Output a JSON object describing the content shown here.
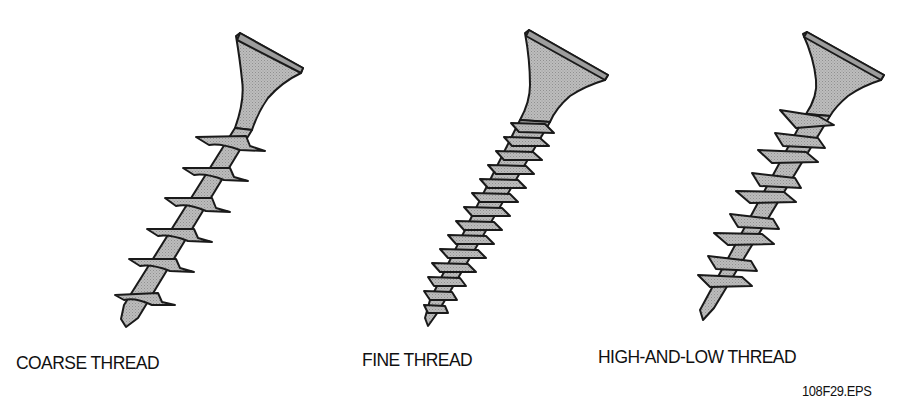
{
  "figure": {
    "screws": [
      {
        "id": "coarse",
        "label": "COARSE THREAD",
        "thread_count": 6
      },
      {
        "id": "fine",
        "label": "FINE THREAD",
        "thread_count": 14
      },
      {
        "id": "high-low",
        "label": "HIGH-AND-LOW THREAD",
        "thread_count": 9
      }
    ],
    "figure_id": "108F29.EPS",
    "colors": {
      "fill": "#b5b5b5",
      "thread_fill": "#a8a8a8",
      "stroke": "#1a1a1a",
      "background": "#ffffff"
    }
  }
}
